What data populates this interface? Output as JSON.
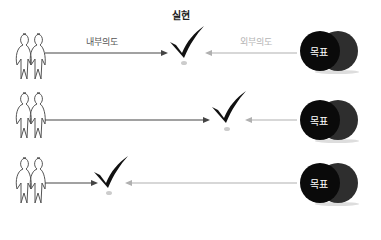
{
  "diagram": {
    "title": "실현",
    "labels": {
      "internal": "내부의도",
      "external": "외부의도"
    },
    "rows": [
      {
        "goal_label": "목표",
        "check_x": 185,
        "description": "checkmark between internal and external intents"
      },
      {
        "goal_label": "목표",
        "check_x": 228,
        "description": "checkmark closer to goal"
      },
      {
        "goal_label": "목표",
        "check_x": 107,
        "description": "checkmark closer to people"
      }
    ],
    "colors": {
      "internal_arrow": "#444444",
      "external_arrow": "#b0b0b0",
      "goal_front": "#0a0a0a",
      "goal_back": "#2e2e2e",
      "check": "#111111"
    }
  }
}
